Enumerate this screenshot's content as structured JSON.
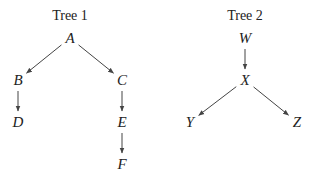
{
  "trees": [
    {
      "title": "Tree 1",
      "title_pos": [
        70,
        16
      ],
      "nodes": [
        {
          "id": "A",
          "label": "A",
          "x": 70,
          "y": 38
        },
        {
          "id": "B",
          "label": "B",
          "x": 18,
          "y": 80
        },
        {
          "id": "C",
          "label": "C",
          "x": 122,
          "y": 80
        },
        {
          "id": "D",
          "label": "D",
          "x": 18,
          "y": 122
        },
        {
          "id": "E",
          "label": "E",
          "x": 122,
          "y": 122
        },
        {
          "id": "F",
          "label": "F",
          "x": 122,
          "y": 164
        }
      ],
      "edges": [
        [
          "A",
          "B"
        ],
        [
          "A",
          "C"
        ],
        [
          "B",
          "D"
        ],
        [
          "C",
          "E"
        ],
        [
          "E",
          "F"
        ]
      ]
    },
    {
      "title": "Tree 2",
      "title_pos": [
        245,
        16
      ],
      "nodes": [
        {
          "id": "W",
          "label": "W",
          "x": 245,
          "y": 38
        },
        {
          "id": "X",
          "label": "X",
          "x": 245,
          "y": 80
        },
        {
          "id": "Y",
          "label": "Y",
          "x": 190,
          "y": 122
        },
        {
          "id": "Z",
          "label": "Z",
          "x": 297,
          "y": 122
        }
      ],
      "edges": [
        [
          "W",
          "X"
        ],
        [
          "X",
          "Y"
        ],
        [
          "X",
          "Z"
        ]
      ]
    }
  ],
  "colors": {
    "text": "#222222",
    "edge": "#444444"
  }
}
